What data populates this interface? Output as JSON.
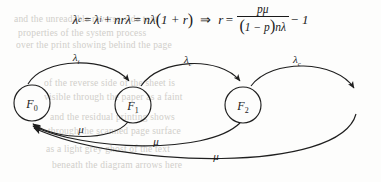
{
  "equation": {
    "lhs_symbol": "λ",
    "lhs_sub": "c",
    "eq1": "=",
    "term1_symbol": "λ",
    "term1_sub": "i",
    "plus": "+",
    "term2": "nrλ",
    "eq2": "=",
    "term3": "nλ",
    "paren_open": "(",
    "paren_body": "1 + r",
    "paren_close": ")",
    "implies": "⇒",
    "rhs_var": "r",
    "eq3": "=",
    "fraction_numerator": "pμ",
    "fraction_denominator_open": "(",
    "fraction_denominator_body": "1 − p",
    "fraction_denominator_close": ")",
    "fraction_denominator_tail": "nλ",
    "minus_one": "− 1"
  },
  "diagram": {
    "type": "markov-state-transition",
    "nodes": [
      {
        "id": "F0",
        "label": "F",
        "sub": "0",
        "cx": 32,
        "cy": 65,
        "r": 18
      },
      {
        "id": "F1",
        "label": "F",
        "sub": "1",
        "cx": 133,
        "cy": 67,
        "r": 18
      },
      {
        "id": "F2",
        "label": "F",
        "sub": "2",
        "cx": 243,
        "cy": 67,
        "r": 18
      }
    ],
    "forward_edges": [
      {
        "from": "F0",
        "to": "F1",
        "label": "λ",
        "sub": "i",
        "lx": 76,
        "ly": 23
      },
      {
        "from": "F1",
        "to": "F2",
        "label": "λ",
        "sub": "c",
        "lx": 188,
        "ly": 25
      },
      {
        "from": "F2",
        "to": "next",
        "label": "λ",
        "sub": "c",
        "lx": 297,
        "ly": 25
      }
    ],
    "return_edges": [
      {
        "from": "F1",
        "to": "F0",
        "label": "μ",
        "lx": 81,
        "ly": 95
      },
      {
        "from": "F2",
        "to": "F0",
        "label": "μ",
        "lx": 156,
        "ly": 107
      },
      {
        "from": "next",
        "to": "F0",
        "label": "μ",
        "lx": 216,
        "ly": 122
      }
    ]
  },
  "background_bleed": [
    {
      "text": "and the unreadable reverse-side text",
      "x": 14,
      "y": 14
    },
    {
      "text": "properties of the system process",
      "x": 18,
      "y": 28
    },
    {
      "text": "over the print showing behind the page",
      "x": 16,
      "y": 40
    },
    {
      "text": "of the reverse side of the sheet is",
      "x": 44,
      "y": 78
    },
    {
      "text": "visible through the paper as a faint",
      "x": 44,
      "y": 92
    },
    {
      "text": "and the residual printing shows",
      "x": 50,
      "y": 112
    },
    {
      "text": "through the scanned page surface",
      "x": 48,
      "y": 126
    },
    {
      "text": "as a light grey ghost of the text",
      "x": 46,
      "y": 144
    },
    {
      "text": "beneath the diagram arrows here",
      "x": 52,
      "y": 160
    }
  ],
  "colors": {
    "ink": "#1f1f1f",
    "paper": "#fdfdfc",
    "bleed": "#c9c7c2"
  }
}
